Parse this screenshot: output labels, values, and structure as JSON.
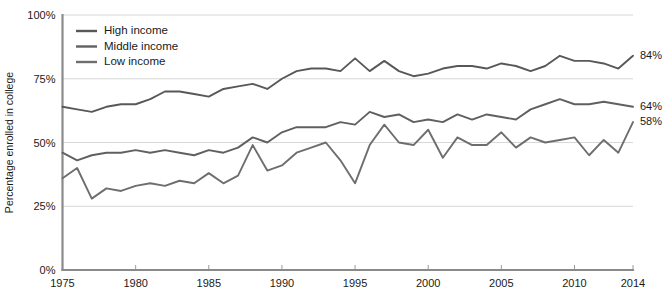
{
  "chart_data": {
    "type": "line",
    "title": "",
    "xlabel": "",
    "ylabel": "Percentage enrolled in college",
    "xlim": [
      1975,
      2014
    ],
    "ylim": [
      0,
      100
    ],
    "grid": true,
    "legend_position": "top-left",
    "x_tick_labels": [
      "1975",
      "1980",
      "1985",
      "1990",
      "1995",
      "2000",
      "2005",
      "2010",
      "2014"
    ],
    "x_ticks": [
      1975,
      1980,
      1985,
      1990,
      1995,
      2000,
      2005,
      2010,
      2014
    ],
    "y_tick_labels": [
      "0%",
      "25%",
      "50%",
      "75%",
      "100%"
    ],
    "y_ticks": [
      0,
      25,
      50,
      75,
      100
    ],
    "x": [
      1975,
      1976,
      1977,
      1978,
      1979,
      1980,
      1981,
      1982,
      1983,
      1984,
      1985,
      1986,
      1987,
      1988,
      1989,
      1990,
      1991,
      1992,
      1993,
      1994,
      1995,
      1996,
      1997,
      1998,
      1999,
      2000,
      2001,
      2002,
      2003,
      2004,
      2005,
      2006,
      2007,
      2008,
      2009,
      2010,
      2011,
      2012,
      2013,
      2014
    ],
    "series": [
      {
        "name": "High income",
        "color": "#585858",
        "end_label": "84%",
        "values": [
          64,
          63,
          62,
          64,
          65,
          65,
          67,
          70,
          70,
          69,
          68,
          71,
          72,
          73,
          71,
          75,
          78,
          79,
          79,
          78,
          83,
          78,
          82,
          78,
          76,
          77,
          79,
          80,
          80,
          79,
          81,
          80,
          78,
          80,
          84,
          82,
          82,
          81,
          79,
          84
        ]
      },
      {
        "name": "Middle income",
        "color": "#606060",
        "end_label": "64%",
        "values": [
          46,
          43,
          45,
          46,
          46,
          47,
          46,
          47,
          46,
          45,
          47,
          46,
          48,
          52,
          50,
          54,
          56,
          56,
          56,
          58,
          57,
          62,
          60,
          61,
          58,
          59,
          58,
          61,
          59,
          61,
          60,
          59,
          63,
          65,
          67,
          65,
          65,
          66,
          65,
          64
        ]
      },
      {
        "name": "Low income",
        "color": "#6e6e6e",
        "end_label": "58%",
        "values": [
          36,
          40,
          28,
          32,
          31,
          33,
          34,
          33,
          35,
          34,
          38,
          34,
          37,
          49,
          39,
          41,
          46,
          48,
          50,
          43,
          34,
          49,
          57,
          50,
          49,
          55,
          44,
          52,
          49,
          49,
          54,
          48,
          52,
          50,
          51,
          52,
          45,
          51,
          46,
          58
        ]
      }
    ]
  },
  "legend": {
    "items": [
      {
        "label": "High income"
      },
      {
        "label": "Middle income"
      },
      {
        "label": "Low income"
      }
    ]
  }
}
